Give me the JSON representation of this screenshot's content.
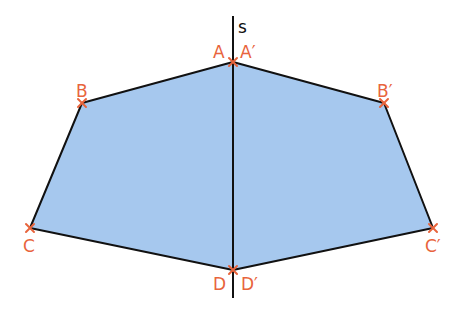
{
  "diagram": {
    "axis": {
      "label": "s",
      "x": 233,
      "y1": 16,
      "y2": 298
    },
    "colors": {
      "fill": "#a6c8ee",
      "stroke": "#111111",
      "point": "#e8643c",
      "label": "#e8643c"
    },
    "points": [
      {
        "name": "A",
        "x": 233,
        "y": 62
      },
      {
        "name": "B",
        "x": 82,
        "y": 103
      },
      {
        "name": "C",
        "x": 30,
        "y": 228
      },
      {
        "name": "D",
        "x": 233,
        "y": 270
      },
      {
        "name": "A'",
        "x": 233,
        "y": 62
      },
      {
        "name": "B'",
        "x": 384,
        "y": 103
      },
      {
        "name": "C'",
        "x": 433,
        "y": 228
      },
      {
        "name": "D'",
        "x": 233,
        "y": 270
      }
    ],
    "labels": {
      "A": "A",
      "A_prime": "A′",
      "B": "B",
      "B_prime": "B′",
      "C": "C",
      "C_prime": "C′",
      "D": "D",
      "D_prime": "D′",
      "s": "s"
    },
    "shapes": [
      {
        "name": "original",
        "vertices": [
          "A",
          "B",
          "C",
          "D"
        ]
      },
      {
        "name": "image",
        "vertices": [
          "A'",
          "B'",
          "C'",
          "D'"
        ]
      }
    ]
  }
}
